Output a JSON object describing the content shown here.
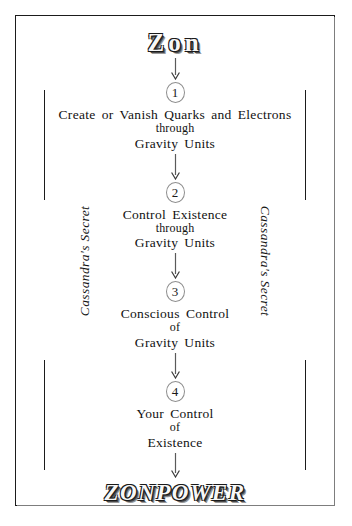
{
  "title": "Zon",
  "footer": "ZONPOWER",
  "side_rails": {
    "left": "Cassandra's Secret",
    "right": "Cassandra's Secret"
  },
  "steps": [
    {
      "number": "1",
      "main": "Create or Vanish Quarks and Electrons",
      "link": "through",
      "tail": "Gravity Units"
    },
    {
      "number": "2",
      "main": "Control Existence",
      "link": "through",
      "tail": "Gravity Units"
    },
    {
      "number": "3",
      "main": "Conscious Control",
      "link": "of",
      "tail": "Gravity Units"
    },
    {
      "number": "4",
      "main": "Your Control",
      "link": "of",
      "tail": "Existence"
    }
  ],
  "colors": {
    "ink": "#111111",
    "frame": "#1b1b1b",
    "bubble_stroke": "#8e8e8e",
    "background": "#ffffff"
  }
}
